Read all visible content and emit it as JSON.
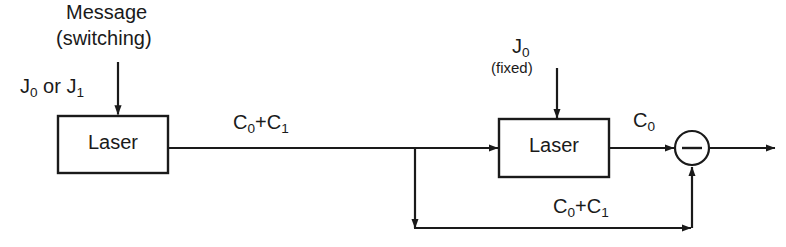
{
  "diagram": {
    "colors": {
      "stroke": "#1a1a1a",
      "background": "#ffffff",
      "text": "#1a1a1a"
    },
    "blocks": [
      {
        "id": "laser1",
        "label": "Laser",
        "x": 58,
        "y": 116,
        "w": 110,
        "h": 57
      },
      {
        "id": "laser2",
        "label": "Laser",
        "x": 499,
        "y": 119,
        "w": 110,
        "h": 58
      }
    ],
    "operator": {
      "id": "summing-junction",
      "symbol": "−",
      "sign": "minus",
      "cx": 692,
      "cy": 148,
      "r": 17
    },
    "labels": {
      "message": "Message",
      "switching": "(switching)",
      "input_source": {
        "prefix": "J",
        "sub1": "0",
        "middle": " or J",
        "sub2": "1"
      },
      "link_c0c1_top": {
        "c": "C",
        "sub1": "0",
        "plus": "+C",
        "sub2": "1"
      },
      "pump_fixed_symbol": {
        "c": "J",
        "sub": "0"
      },
      "pump_fixed_note": "(fixed)",
      "output_c0": {
        "c": "C",
        "sub": "0"
      },
      "feedback_c0c1": {
        "c": "C",
        "sub1": "0",
        "plus": "+C",
        "sub2": "1"
      }
    },
    "connections": [
      {
        "name": "message-arrow-into-laser1",
        "from": [
          118,
          62
        ],
        "to": [
          118,
          114
        ],
        "arrow": "down"
      },
      {
        "name": "laser1-output-line",
        "from": [
          168,
          148
        ],
        "to": [
          499,
          148
        ],
        "arrow": "right-at-laser2"
      },
      {
        "name": "branch-down-to-feedback",
        "from": [
          415,
          148
        ],
        "to": [
          415,
          228
        ],
        "arrow": "down"
      },
      {
        "name": "pump-arrow-into-laser2",
        "from": [
          557,
          68
        ],
        "to": [
          557,
          117
        ],
        "arrow": "down"
      },
      {
        "name": "laser2-output-to-junction",
        "from": [
          609,
          148
        ],
        "to": [
          675,
          148
        ],
        "arrow": "right"
      },
      {
        "name": "junction-output",
        "from": [
          710,
          148
        ],
        "to": [
          776,
          148
        ],
        "arrow": "right"
      },
      {
        "name": "feedback-bottom-line",
        "from": [
          415,
          228
        ],
        "to": [
          692,
          228
        ],
        "arrow": "right"
      },
      {
        "name": "feedback-up-into-junction",
        "from": [
          692,
          228
        ],
        "to": [
          692,
          166
        ],
        "arrow": "up"
      }
    ]
  }
}
